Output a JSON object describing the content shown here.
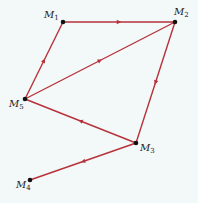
{
  "diagram": {
    "type": "directed-graph",
    "background": "#f3f8f8",
    "edge_color": "#b7323b",
    "nodes": [
      {
        "id": "M1",
        "label": "M",
        "sub": "1",
        "x": 63,
        "y": 22,
        "label_x": 44,
        "label_y": 18
      },
      {
        "id": "M2",
        "label": "M",
        "sub": "2",
        "x": 175,
        "y": 22,
        "label_x": 174,
        "label_y": 15
      },
      {
        "id": "M3",
        "label": "M",
        "sub": "3",
        "x": 136,
        "y": 143,
        "label_x": 140,
        "label_y": 151
      },
      {
        "id": "M4",
        "label": "M",
        "sub": "4",
        "x": 30,
        "y": 180,
        "label_x": 16,
        "label_y": 188
      },
      {
        "id": "M5",
        "label": "M",
        "sub": "5",
        "x": 25,
        "y": 99,
        "label_x": 9,
        "label_y": 107
      }
    ],
    "edges": [
      {
        "from": "M1",
        "to": "M2"
      },
      {
        "from": "M5",
        "to": "M1"
      },
      {
        "from": "M5",
        "to": "M2"
      },
      {
        "from": "M2",
        "to": "M3"
      },
      {
        "from": "M3",
        "to": "M5"
      },
      {
        "from": "M3",
        "to": "M4"
      }
    ]
  }
}
